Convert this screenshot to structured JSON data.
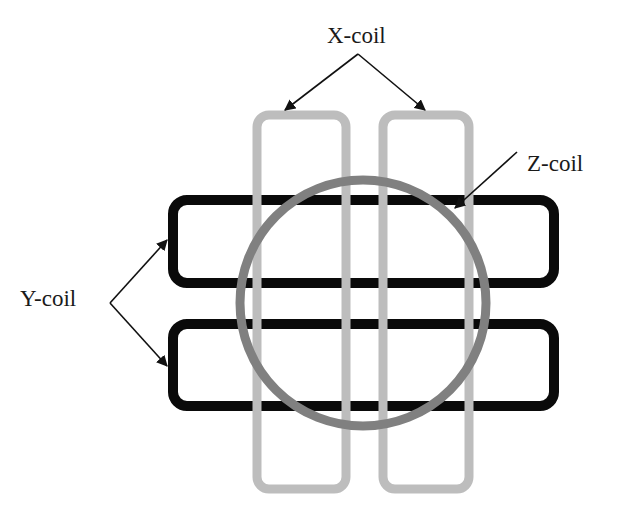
{
  "diagram": {
    "title": "",
    "labels": {
      "x_coil": "X-coil",
      "y_coil": "Y-coil",
      "z_coil": "Z-coil"
    },
    "colors": {
      "background": "#ffffff",
      "x_coil": "#bdbdbd",
      "y_coil": "#0a0a0a",
      "z_coil": "#808080",
      "arrow": "#111111",
      "text": "#1a1a1a"
    },
    "x_coils": [
      {
        "id": "x-coil-left",
        "x": 257,
        "y": 115,
        "width": 89,
        "height": 374,
        "rx": 12,
        "stroke_width": 9
      },
      {
        "id": "x-coil-right",
        "x": 383,
        "y": 115,
        "width": 86,
        "height": 374,
        "rx": 12,
        "stroke_width": 9
      }
    ],
    "y_coils": [
      {
        "id": "y-coil-top",
        "x": 173,
        "y": 200,
        "width": 381,
        "height": 83,
        "rx": 14,
        "stroke_width": 10
      },
      {
        "id": "y-coil-bottom",
        "x": 173,
        "y": 324,
        "width": 381,
        "height": 82,
        "rx": 14,
        "stroke_width": 10
      }
    ],
    "z_coil": {
      "id": "z-coil",
      "cx": 363,
      "cy": 303,
      "r": 123,
      "stroke_width": 9
    },
    "text_positions": {
      "x_coil": {
        "x": 327,
        "y": 43
      },
      "y_coil": {
        "x": 20,
        "y": 306
      },
      "z_coil": {
        "x": 527,
        "y": 171
      }
    },
    "arrows": [
      {
        "id": "x-arrow-left",
        "x1": 358,
        "y1": 54,
        "x2": 285,
        "y2": 110
      },
      {
        "id": "x-arrow-right",
        "x1": 358,
        "y1": 54,
        "x2": 425,
        "y2": 110
      },
      {
        "id": "y-arrow-top",
        "x1": 110,
        "y1": 303,
        "x2": 167,
        "y2": 240
      },
      {
        "id": "y-arrow-bottom",
        "x1": 110,
        "y1": 303,
        "x2": 167,
        "y2": 366
      },
      {
        "id": "z-arrow",
        "x1": 517,
        "y1": 152,
        "x2": 455,
        "y2": 208
      }
    ]
  }
}
